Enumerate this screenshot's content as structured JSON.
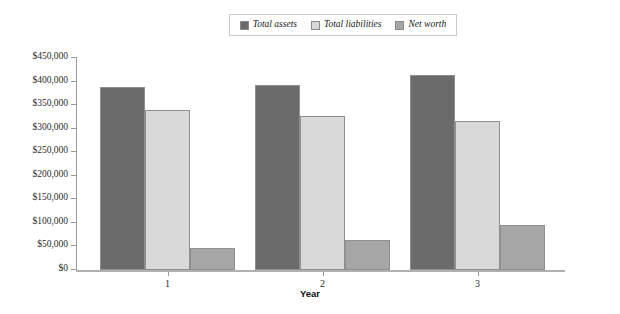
{
  "chart_data": {
    "type": "bar",
    "title": "",
    "subtitle": "",
    "xlabel": "Year",
    "ylabel": "",
    "categories": [
      "1",
      "2",
      "3"
    ],
    "series": [
      {
        "name": "Total assets",
        "color": "#6b6b6b",
        "values": [
          388000,
          393000,
          415000
        ]
      },
      {
        "name": "Total liabilities",
        "color": "#d9d9d9",
        "values": [
          340000,
          327000,
          316000
        ]
      },
      {
        "name": "Net worth",
        "color": "#a6a6a6",
        "values": [
          47000,
          64000,
          95000
        ]
      }
    ],
    "ylim": [
      0,
      450000
    ],
    "ytick_values": [
      0,
      50000,
      100000,
      150000,
      200000,
      250000,
      300000,
      350000,
      400000,
      450000
    ],
    "ytick_labels": [
      "$0",
      "$50,000",
      "$100,000",
      "$150,000",
      "$200,000",
      "$250,000",
      "$300,000",
      "$350,000",
      "$400,000",
      "$450,000"
    ],
    "grid": false,
    "legend_position": "top-center",
    "legend_entries": [
      "Total assets",
      "Total liabilities",
      "Net worth"
    ]
  }
}
